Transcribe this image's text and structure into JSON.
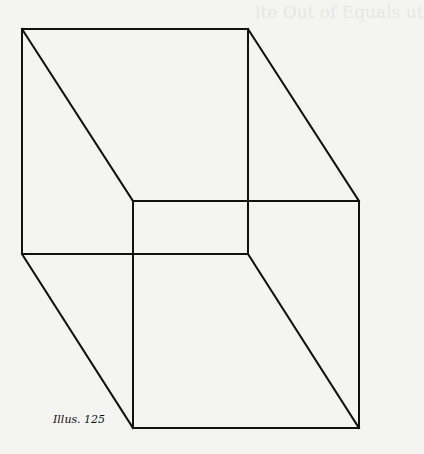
{
  "figure": {
    "caption": "Illus. 125",
    "type": "Necker cube line drawing",
    "line_color": "#111111",
    "background": "#f4f4f2",
    "vertices": {
      "back_top_left": [
        22,
        29
      ],
      "back_top_right": [
        248,
        29
      ],
      "back_bottom_left": [
        22,
        254
      ],
      "back_bottom_right": [
        248,
        254
      ],
      "front_top_left": [
        133,
        201
      ],
      "front_top_right": [
        359,
        201
      ],
      "front_bottom_left": [
        133,
        428
      ],
      "front_bottom_right": [
        359,
        428
      ]
    }
  },
  "bleed_through": {
    "title": "ite Out of Equals ut"
  }
}
